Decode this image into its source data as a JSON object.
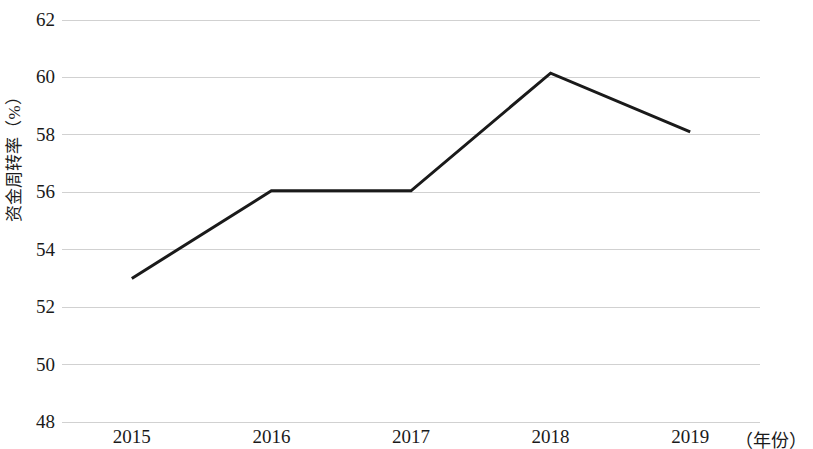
{
  "chart_data": {
    "type": "line",
    "title": "",
    "subtitle": "",
    "xlabel": "（年份）",
    "ylabel": "资金周转率（%）",
    "categories": [
      "2015",
      "2016",
      "2017",
      "2018",
      "2019"
    ],
    "values": [
      53.0,
      56.05,
      56.05,
      60.15,
      58.1
    ],
    "series": [
      {
        "name": "资金周转率",
        "values": [
          53.0,
          56.05,
          56.05,
          60.15,
          58.1
        ]
      }
    ],
    "ylim": [
      48,
      62
    ],
    "ytick_labels": [
      "62",
      "60",
      "58",
      "56",
      "54",
      "52",
      "50",
      "48"
    ],
    "yticks": [
      62,
      60,
      58,
      56,
      54,
      52,
      50,
      48
    ],
    "grid": true,
    "grid_color": "#c9c9c9",
    "legend": false,
    "legend_position": "none",
    "line_color": "#1a1a1a",
    "line_width": 3,
    "markers": false,
    "background_color": "#ffffff",
    "axis_line_visible": false
  },
  "axes": {
    "y_title": "资金周转率（%）",
    "x_title": "（年份）"
  }
}
